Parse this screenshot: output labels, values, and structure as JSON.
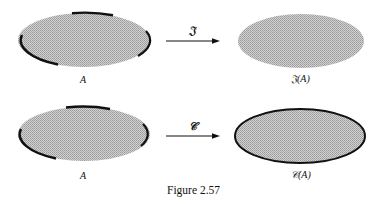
{
  "figure": {
    "caption": "Figure 2.57",
    "rows": [
      {
        "source_label": "A",
        "operator_label": "𝔍",
        "result_label": "𝔍(A)",
        "description": "Set A with partial boundary arcs; interior operator yields ellipse without boundary"
      },
      {
        "source_label": "A",
        "operator_label": "𝒞",
        "result_label": "𝒞(A)",
        "description": "Set A with partial boundary arcs; closure operator yields ellipse with full boundary"
      }
    ],
    "colors": {
      "fill": "#b8b8b8",
      "boundary": "#111111",
      "arrow": "#111111"
    }
  }
}
